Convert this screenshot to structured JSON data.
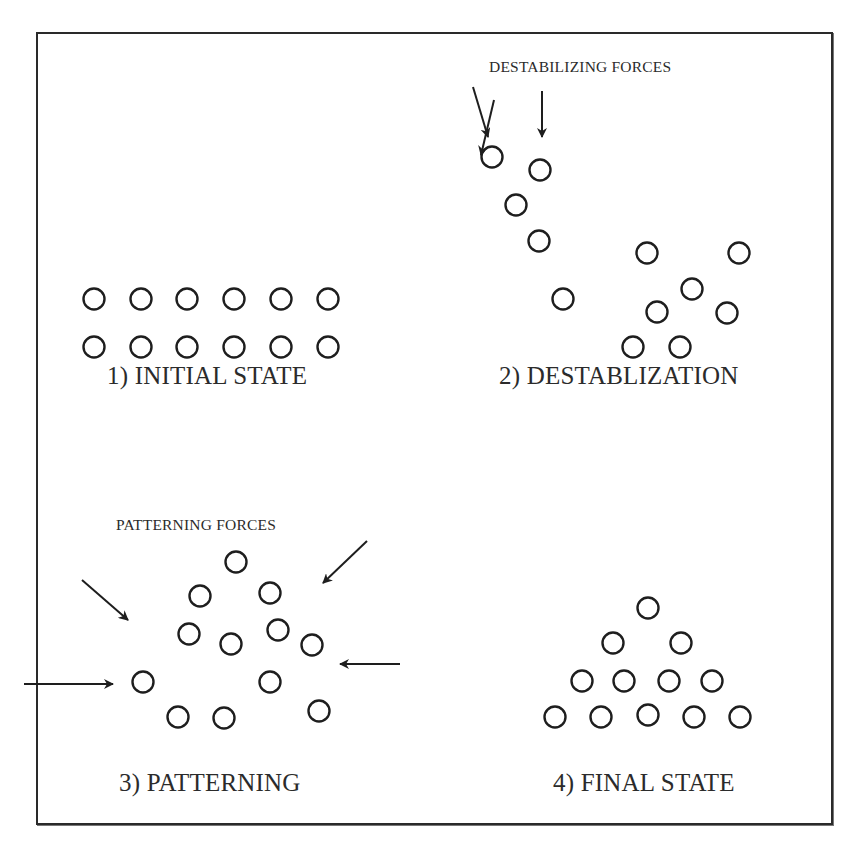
{
  "figure": {
    "frame_color": "#2a2a2a",
    "circle_radius": 10.5,
    "panels": [
      {
        "id": "initial",
        "title": "1) INITIAL STATE",
        "title_pos": [
          107,
          386
        ],
        "circles": [
          [
            94,
            299
          ],
          [
            141,
            299
          ],
          [
            187,
            299
          ],
          [
            234,
            299
          ],
          [
            281,
            299
          ],
          [
            328,
            299
          ],
          [
            94,
            347
          ],
          [
            141,
            347
          ],
          [
            187,
            347
          ],
          [
            234,
            347
          ],
          [
            281,
            347
          ],
          [
            328,
            347
          ]
        ]
      },
      {
        "id": "destabilization",
        "title": "2) DESTABLIZATION",
        "title_pos": [
          499,
          386
        ],
        "force_label": "DESTABILIZING FORCES",
        "force_label_pos": [
          489,
          4
        ],
        "circles": [
          [
            492,
            157
          ],
          [
            540,
            170
          ],
          [
            516,
            205
          ],
          [
            539,
            241
          ],
          [
            563,
            299
          ],
          [
            647,
            253
          ],
          [
            739,
            253
          ],
          [
            692,
            289
          ],
          [
            657,
            312
          ],
          [
            727,
            313
          ],
          [
            633,
            347
          ],
          [
            680,
            347
          ]
        ],
        "arrows": [
          [
            473,
            87,
            488,
            137
          ],
          [
            542,
            91,
            542,
            137
          ],
          [
            494,
            100,
            481,
            155
          ]
        ]
      },
      {
        "id": "patterning",
        "title": "3) PATTERNING",
        "title_pos": [
          119,
          793
        ],
        "force_label": "PATTERNING FORCES",
        "force_label_pos": [
          116,
          532
        ],
        "circles": [
          [
            236,
            562
          ],
          [
            200,
            596
          ],
          [
            270,
            593
          ],
          [
            189,
            634
          ],
          [
            231,
            644
          ],
          [
            278,
            630
          ],
          [
            312,
            645
          ],
          [
            143,
            682
          ],
          [
            270,
            682
          ],
          [
            178,
            717
          ],
          [
            224,
            718
          ],
          [
            319,
            711
          ]
        ],
        "arrows": [
          [
            82,
            580,
            128,
            620
          ],
          [
            367,
            541,
            323,
            583
          ],
          [
            24,
            684,
            113,
            684
          ],
          [
            400,
            664,
            340,
            664
          ]
        ]
      },
      {
        "id": "final",
        "title": "4) FINAL STATE",
        "title_pos": [
          553,
          793
        ],
        "circles": [
          [
            648,
            608
          ],
          [
            613,
            643
          ],
          [
            681,
            643
          ],
          [
            582,
            681
          ],
          [
            624,
            681
          ],
          [
            669,
            681
          ],
          [
            712,
            681
          ],
          [
            555,
            717
          ],
          [
            601,
            717
          ],
          [
            648,
            715
          ],
          [
            694,
            717
          ],
          [
            740,
            717
          ]
        ]
      }
    ]
  }
}
